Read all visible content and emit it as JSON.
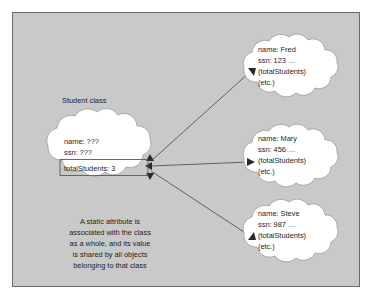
{
  "diagram": {
    "title_label": "Student class",
    "panel_color": "#c9c9c9",
    "cloud_fill": "#ffffff",
    "line_color": "#555555",
    "class_cloud": {
      "name_attr": "name: ???",
      "ssn_attr": "ssn: ???",
      "static_attr": "totalStudents: 3"
    },
    "objects": [
      {
        "name_attr": "name: Fred",
        "ssn_attr": "ssn: 123 …",
        "static_ref": "(totalStudents)",
        "etc": "(etc.)"
      },
      {
        "name_attr": "name: Mary",
        "ssn_attr": "ssn: 456 …",
        "static_ref": "(totalStudents)",
        "etc": "(etc.)"
      },
      {
        "name_attr": "name: Steve",
        "ssn_attr": "ssn: 987 …",
        "static_ref": "(totalStudents)",
        "etc": "(etc.)"
      }
    ],
    "caption": {
      "line1": "A static attribute is",
      "line2": "associated with the class",
      "line3": "as a whole, and its value",
      "line4": "is shared by all objects",
      "line5": "belonging to that class"
    }
  }
}
